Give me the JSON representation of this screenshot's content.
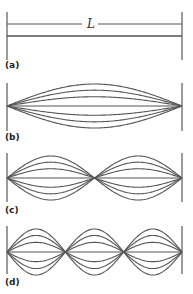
{
  "figure": {
    "length_label": "L",
    "panels": [
      {
        "id": "a",
        "label": "(a)",
        "harmonic": 0
      },
      {
        "id": "b",
        "label": "(b)",
        "harmonic": 1
      },
      {
        "id": "c",
        "label": "(c)",
        "harmonic": 2
      },
      {
        "id": "d",
        "label": "(d)",
        "harmonic": 3
      }
    ],
    "colors": {
      "line": "#555555",
      "wall": "#666666",
      "background": "#ffffff"
    }
  }
}
